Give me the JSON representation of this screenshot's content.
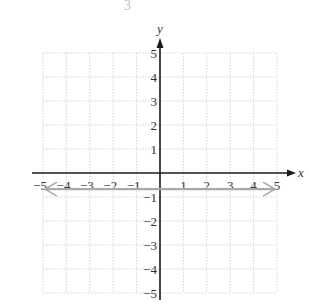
{
  "header_fragment": "3",
  "chart_data": {
    "type": "line",
    "title": "",
    "xlabel": "x",
    "ylabel": "y",
    "xlim": [
      -5,
      5
    ],
    "ylim": [
      -5,
      5
    ],
    "grid": true,
    "grid_style": "dotted",
    "x_ticks": [
      -5,
      -4,
      -3,
      -2,
      -1,
      1,
      2,
      3,
      4,
      5
    ],
    "y_ticks": [
      5,
      4,
      3,
      2,
      1,
      -1,
      -2,
      -3,
      -4,
      -5
    ],
    "x_tick_labels": [
      "−5",
      "−4",
      "−3",
      "−2",
      "−1",
      "1",
      "2",
      "3",
      "4",
      "5"
    ],
    "y_tick_labels": [
      "5",
      "4",
      "3",
      "2",
      "1",
      "−1",
      "−2",
      "−3",
      "−4",
      "−5"
    ],
    "series": [
      {
        "name": "horizontal line",
        "kind": "line with arrows at both ends",
        "color": "#a9a9a9",
        "x": [
          -5,
          5
        ],
        "y": [
          -0.67,
          -0.67
        ]
      }
    ],
    "colors": {
      "axis": "#1a1a1a",
      "grid": "#c8c8c8",
      "line": "#a9a9a9",
      "text": "#333333"
    }
  }
}
